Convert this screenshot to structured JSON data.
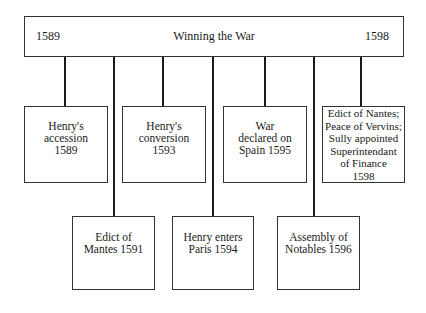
{
  "header": {
    "start_year": "1589",
    "title": "Winning the War",
    "end_year": "1598"
  },
  "events_top": [
    {
      "label": "Henry's\naccession\n1589"
    },
    {
      "label": "Henry's\nconversion\n1593"
    },
    {
      "label": "War\ndeclared on\nSpain 1595"
    },
    {
      "label": "Edict of Nantes;\nPeace of Vervins;\nSully appointed\nSuperintendant\nof Finance\n1598"
    }
  ],
  "events_bottom": [
    {
      "label": "Edict of\nMantes 1591"
    },
    {
      "label": "Henry enters\nParis 1594"
    },
    {
      "label": "Assembly of\nNotables 1596"
    }
  ],
  "colors": {
    "line": "#1a1a1a",
    "border": "#333333",
    "background": "#ffffff"
  }
}
